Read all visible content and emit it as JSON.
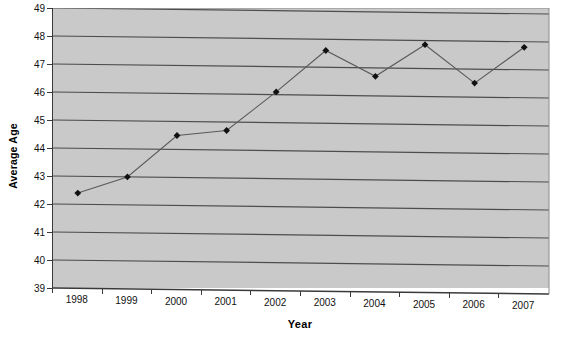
{
  "chart_data": {
    "type": "line",
    "title": "",
    "xlabel": "Year",
    "ylabel": "Average Age",
    "categories": [
      "1998",
      "1999",
      "2000",
      "2001",
      "2002",
      "2003",
      "2004",
      "2005",
      "2006",
      "2007"
    ],
    "x": [
      1998,
      1999,
      2000,
      2001,
      2002,
      2003,
      2004,
      2005,
      2006,
      2007
    ],
    "values": [
      42.4,
      43.0,
      44.5,
      44.7,
      46.1,
      47.6,
      46.7,
      47.85,
      46.5,
      47.8
    ],
    "series": [
      {
        "name": "Average Age",
        "values": [
          42.4,
          43.0,
          44.5,
          44.7,
          46.1,
          47.6,
          46.7,
          47.85,
          46.5,
          47.8
        ]
      }
    ],
    "ylim": [
      39,
      49
    ],
    "ytick_labels": [
      "39",
      "40",
      "41",
      "42",
      "43",
      "44",
      "45",
      "46",
      "47",
      "48",
      "49"
    ],
    "ytick_values": [
      39,
      40,
      41,
      42,
      43,
      44,
      45,
      46,
      47,
      48,
      49
    ],
    "xtick_labels": [
      "1998",
      "1999",
      "2000",
      "2001",
      "2002",
      "2003",
      "2004",
      "2005",
      "2006",
      "2007"
    ],
    "grid": true,
    "grid_axis": "y",
    "legend": false,
    "legend_position": "none",
    "marker": "diamond",
    "plot_background_color": "#c9c9c9",
    "line_color": "#5a5a5a",
    "marker_color": "#111111",
    "gridline_color": "#4d4d4d",
    "axis_color": "#3a3a3a",
    "annotations": []
  }
}
